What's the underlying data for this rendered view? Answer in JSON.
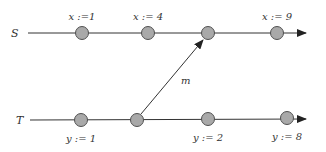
{
  "diagram": {
    "processes": [
      {
        "name": "S",
        "y": 33,
        "events": [
          {
            "x": 82,
            "label": "x :=1",
            "label_pos": "above"
          },
          {
            "x": 148,
            "label": "x := 4",
            "label_pos": "above"
          },
          {
            "x": 208,
            "label": "",
            "label_pos": "none"
          },
          {
            "x": 277,
            "label": "x := 9",
            "label_pos": "above"
          }
        ]
      },
      {
        "name": "T",
        "y": 120,
        "events": [
          {
            "x": 81,
            "label": "y := 1",
            "label_pos": "below"
          },
          {
            "x": 137,
            "label": "",
            "label_pos": "none"
          },
          {
            "x": 208,
            "label": "y := 2",
            "label_pos": "below"
          },
          {
            "x": 287,
            "label": "y := 8",
            "label_pos": "below"
          }
        ]
      }
    ],
    "messages": [
      {
        "label": "m",
        "from": "T.event2",
        "to": "S.event3"
      }
    ],
    "colors": {
      "node_fill": "#a9a9a9",
      "node_stroke": "#505050",
      "line": "#333333",
      "text": "#333333"
    }
  }
}
